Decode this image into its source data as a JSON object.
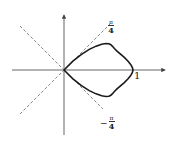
{
  "figure": {
    "labels": {
      "upper_ray": {
        "numerator": "π",
        "denominator": "4"
      },
      "lower_ray": {
        "sign": "−",
        "numerator": "π",
        "denominator": "4"
      },
      "x_intercept": "1"
    },
    "colors": {
      "curve": "#1a1a1a",
      "axis": "#555555",
      "dashed": "#666666"
    }
  },
  "chart_data": {
    "type": "line",
    "title": "",
    "xlabel": "",
    "ylabel": "",
    "curve": "r = cos(2θ), θ ∈ [-π/4, π/4]",
    "series": [
      {
        "name": "loop",
        "x": [
          0,
          0.129,
          0.253,
          0.366,
          0.465,
          0.546,
          0.607,
          0.65,
          0.679,
          0.703,
          0.73,
          0.768,
          0.819,
          0.874,
          0.925,
          0.966,
          0.991,
          1.0,
          0.991,
          0.966,
          0.925,
          0.874,
          0.819,
          0.768,
          0.73,
          0.703,
          0.679,
          0.65,
          0.607,
          0.546,
          0.465,
          0.366,
          0.253,
          0.129,
          0
        ],
        "y": [
          0,
          0.129,
          0.227,
          0.299,
          0.346,
          0.374,
          0.385,
          0.381,
          0.366,
          0.343,
          0.312,
          0.274,
          0.23,
          0.182,
          0.13,
          0.08,
          0.035,
          0,
          -0.035,
          -0.08,
          -0.13,
          -0.182,
          -0.23,
          -0.274,
          -0.312,
          -0.343,
          -0.366,
          -0.381,
          -0.385,
          -0.374,
          -0.346,
          -0.299,
          -0.227,
          -0.129,
          0
        ]
      }
    ],
    "annotations": [
      "π/4",
      "−π/4",
      "1"
    ],
    "reference_lines": [
      "θ = π/4 (dashed)",
      "θ = −π/4 (dashed)"
    ],
    "xlim": [
      -0.75,
      1.45
    ],
    "ylim": [
      -0.95,
      0.8
    ],
    "grid": false,
    "legend": "none"
  }
}
